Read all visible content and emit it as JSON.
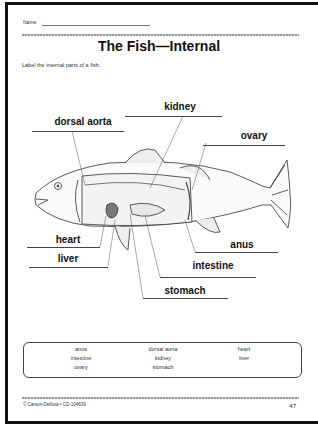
{
  "header": {
    "name_label": "Name",
    "title": "The Fish—Internal",
    "instructions": "Label the internal parts of a fish."
  },
  "diagram": {
    "labels": [
      {
        "id": "kidney",
        "text": "kidney"
      },
      {
        "id": "dorsal_aorta",
        "text": "dorsal aorta"
      },
      {
        "id": "ovary",
        "text": "ovary"
      },
      {
        "id": "heart",
        "text": "heart"
      },
      {
        "id": "liver",
        "text": "liver"
      },
      {
        "id": "anus",
        "text": "anus"
      },
      {
        "id": "intestine",
        "text": "intestine"
      },
      {
        "id": "stomach",
        "text": "stomach"
      }
    ]
  },
  "word_bank": {
    "items": [
      "anus",
      "dorsal aorta",
      "heart",
      "intestine",
      "kidney",
      "liver",
      "ovary",
      "stomach"
    ]
  },
  "footer": {
    "copyright": "© Carson-Dellosa • CD-104639",
    "page_number": "47"
  }
}
